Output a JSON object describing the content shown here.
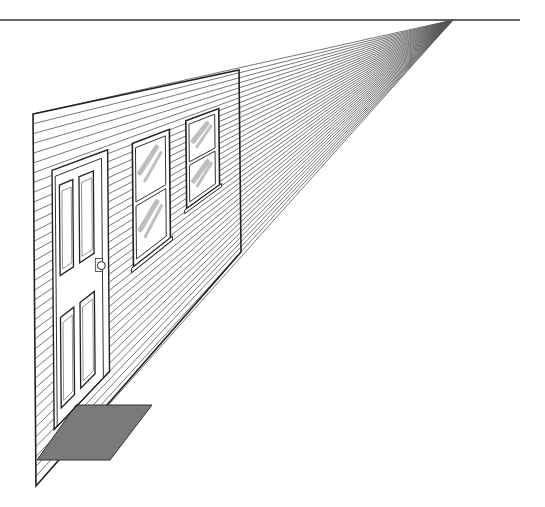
{
  "figure": {
    "title": "One-point perspective: house wall with door and windows"
  },
  "scene": {
    "horizon": {
      "y": 20,
      "x1": 0,
      "x2": 520,
      "color": "#333333"
    },
    "vanishing_point": {
      "x": 453,
      "y": 20
    },
    "wall": {
      "corners": [
        [
          33,
          114
        ],
        [
          239,
          70
        ],
        [
          241,
          252
        ],
        [
          36,
          486
        ]
      ],
      "stroke": "#222222",
      "siding_line_count": 38
    },
    "door": {
      "label": "Door",
      "knob": "door-knob"
    },
    "windows": [
      {
        "label": "Window 1",
        "type": "double-hung"
      },
      {
        "label": "Window 2",
        "type": "double-hung"
      }
    ],
    "doormat": {
      "label": "Doormat",
      "fill": "#7a7a7a"
    },
    "glass_reflection_color": "#bfbfbf",
    "line_color": "#555555"
  }
}
